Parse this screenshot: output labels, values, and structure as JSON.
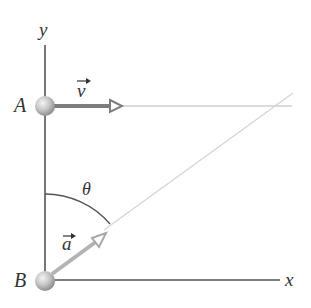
{
  "diagram": {
    "type": "kinematics-sketch",
    "axes": {
      "y_label": "y",
      "x_label": "x"
    },
    "points": [
      {
        "id": "A",
        "label": "A",
        "x": 45,
        "y": 106
      },
      {
        "id": "B",
        "label": "B",
        "x": 45,
        "y": 280
      }
    ],
    "vectors": [
      {
        "id": "v",
        "label": "v",
        "from": "A",
        "direction": "horizontal-right",
        "color": "#808080"
      },
      {
        "id": "a",
        "label": "a",
        "from": "B",
        "direction": "angle-theta-from-y",
        "color": "#b3b3b3"
      }
    ],
    "angle": {
      "label": "θ",
      "between": [
        "y-axis",
        "vector-a"
      ]
    },
    "colors": {
      "axis": "#555555",
      "vector_v": "#808080",
      "vector_a": "#b8b8b8",
      "guide_line": "#cccccc",
      "ball": "#c4c4c4",
      "text": "#333333"
    }
  }
}
